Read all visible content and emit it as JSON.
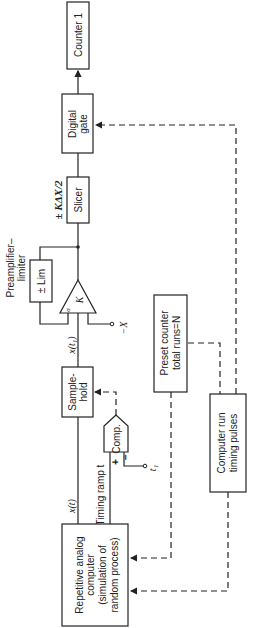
{
  "orientation": "rotated 90deg counter-clockwise",
  "blocks": {
    "counter": {
      "label": "Counter 1"
    },
    "digital_gate": {
      "line1": "Digital",
      "line2": "gate"
    },
    "slicer": {
      "label": "Slicer",
      "annotation": "± KΔX/2"
    },
    "preamp": {
      "title1": "Preamplifier–",
      "title2": "limiter",
      "limiter_label": "± Lim",
      "gain_label": "K",
      "input_mark": "σ",
      "ref_input": "−X"
    },
    "sample_hold": {
      "line1": "Sample-",
      "line2": "hold",
      "output_signal": "x(t₁)"
    },
    "comparator": {
      "label": "Comp.",
      "plus": "+",
      "minus": "−",
      "ref_input": "t₁"
    },
    "preset_counter": {
      "line1": "Preset counter",
      "line2": "total runs=N"
    },
    "timing_pulses": {
      "line1": "Computer run",
      "line2": "timing pulses"
    },
    "analog_computer": {
      "line1": "Repetitive analog",
      "line2": "computer",
      "line3": "(simulation of",
      "line4": "random process)",
      "output_signal": "x(t)",
      "ramp_label": "Timing ramp t"
    }
  }
}
